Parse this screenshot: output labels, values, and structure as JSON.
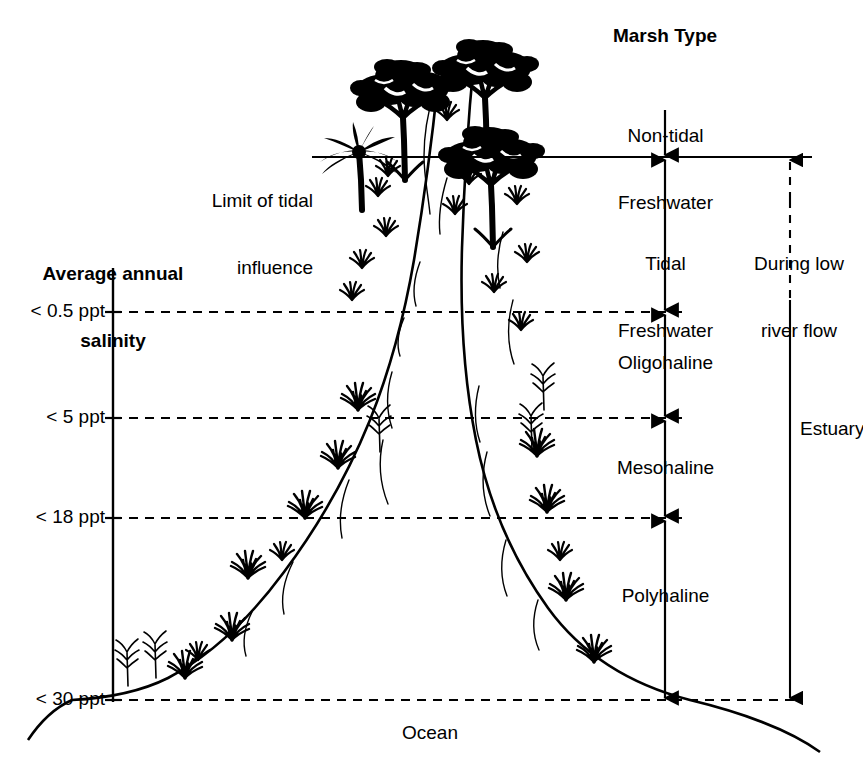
{
  "figure": {
    "kind": "estuary-marsh-zonation-diagram",
    "background_color": "#ffffff",
    "ink_color": "#000000"
  },
  "left_axis": {
    "title_line1": "Average annual",
    "title_line2": "salinity",
    "ticks": [
      {
        "label": "< 0.5 ppt",
        "y": 312
      },
      {
        "label": "< 5 ppt",
        "y": 418
      },
      {
        "label": "< 18 ppt",
        "y": 518
      },
      {
        "label": "< 30 ppt",
        "y": 700
      }
    ]
  },
  "right_axis": {
    "title": "Marsh Type",
    "zones": [
      {
        "label_line1": "Non-tidal",
        "label_line2": "Freshwater",
        "top": 60,
        "bottom": 157
      },
      {
        "label_line1": "Tidal",
        "label_line2": "Freshwater",
        "top": 157,
        "bottom": 312
      },
      {
        "label_line1": "Oligohaline",
        "label_line2": "",
        "top": 312,
        "bottom": 418
      },
      {
        "label_line1": "Mesohaline",
        "label_line2": "",
        "top": 418,
        "bottom": 518
      },
      {
        "label_line1": "Polyhaline",
        "label_line2": "",
        "top": 518,
        "bottom": 700
      }
    ]
  },
  "annotations": {
    "tidal_limit_line1": "Limit of tidal",
    "tidal_limit_line2": "influence",
    "low_flow_line1": "During low",
    "low_flow_line2": "river flow",
    "estuary": "Estuary",
    "ocean": "Ocean"
  }
}
